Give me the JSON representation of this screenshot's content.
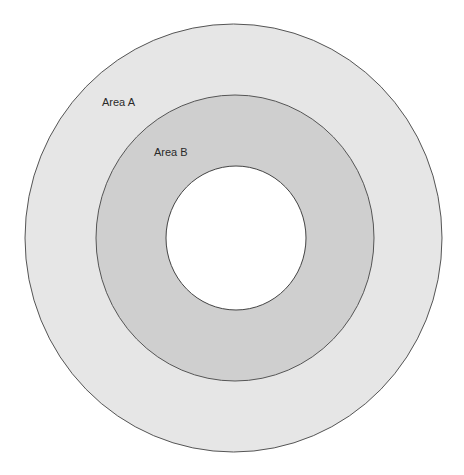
{
  "diagram": {
    "type": "concentric-circles",
    "regions": [
      {
        "name": "Area A",
        "label": "Area A",
        "fill": "#e6e6e6"
      },
      {
        "name": "Area B",
        "label": "Area B",
        "fill": "#cfcfcf"
      },
      {
        "name": "center",
        "label": "",
        "fill": "#ffffff"
      }
    ],
    "stroke": "#555555"
  }
}
